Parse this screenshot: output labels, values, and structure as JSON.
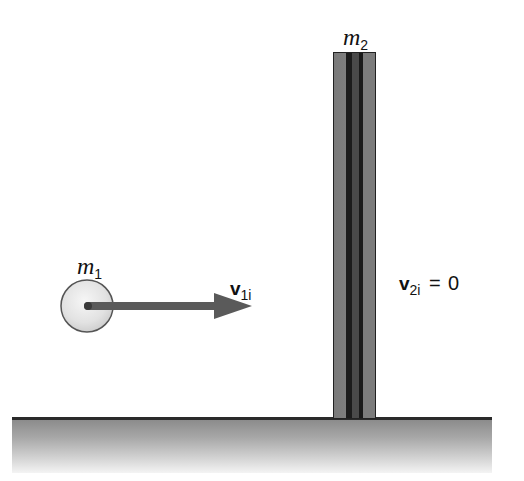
{
  "diagram": {
    "title": "",
    "colors": {
      "ball_fill": "#e4e4e4",
      "ball_stroke": "#555555",
      "arrow": "#5a5a5a",
      "post_outer": "#7c7c7c",
      "post_stripe": "#1c1c1c",
      "post_core": "#4a4a4a",
      "ground_top_line": "#2a2a2a",
      "ground_gradient_top": "#8a8a8a",
      "ground_gradient_bottom": "#f4f4f4"
    },
    "objects": {
      "ball": {
        "mass_label": {
          "symbol": "m",
          "subscript": "1"
        },
        "velocity_label": {
          "symbol": "v",
          "subscript": "1i"
        }
      },
      "post": {
        "mass_label": {
          "symbol": "m",
          "subscript": "2"
        },
        "velocity_label": {
          "symbol": "v",
          "subscript": "2i",
          "equals": "=",
          "value": "0"
        }
      },
      "ground": {
        "label": ""
      }
    }
  }
}
